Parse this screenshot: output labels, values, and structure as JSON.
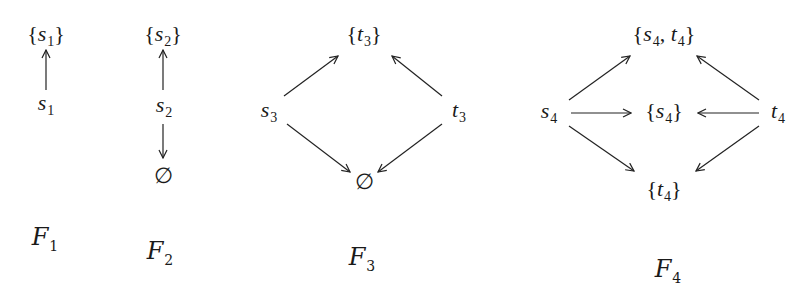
{
  "figure": {
    "diagrams": [
      {
        "label": "F",
        "label_sub": "1",
        "nodes": {
          "top": {
            "pre": "{",
            "var": "s",
            "sub": "1",
            "post": "}"
          },
          "source": {
            "var": "s",
            "sub": "1"
          }
        },
        "edges": [
          [
            "source",
            "top"
          ]
        ]
      },
      {
        "label": "F",
        "label_sub": "2",
        "nodes": {
          "top": {
            "pre": "{",
            "var": "s",
            "sub": "2",
            "post": "}"
          },
          "source": {
            "var": "s",
            "sub": "2"
          },
          "bottom": {
            "symbol": "∅"
          }
        },
        "edges": [
          [
            "source",
            "top"
          ],
          [
            "source",
            "bottom"
          ]
        ]
      },
      {
        "label": "F",
        "label_sub": "3",
        "nodes": {
          "top": {
            "pre": "{",
            "var": "t",
            "sub": "3",
            "post": "}"
          },
          "left": {
            "var": "s",
            "sub": "3"
          },
          "right": {
            "var": "t",
            "sub": "3"
          },
          "bottom": {
            "symbol": "∅"
          }
        },
        "edges": [
          [
            "left",
            "top"
          ],
          [
            "right",
            "top"
          ],
          [
            "left",
            "bottom"
          ],
          [
            "right",
            "bottom"
          ]
        ]
      },
      {
        "label": "F",
        "label_sub": "4",
        "nodes": {
          "top": {
            "pre": "{",
            "var": "s",
            "sub": "4",
            "mid": ", ",
            "var2": "t",
            "sub2": "4",
            "post": "}"
          },
          "left": {
            "var": "s",
            "sub": "4"
          },
          "middle": {
            "pre": "{",
            "var": "s",
            "sub": "4",
            "post": "}"
          },
          "right": {
            "var": "t",
            "sub": "4"
          },
          "bottom": {
            "pre": "{",
            "var": "t",
            "sub": "4",
            "post": "}"
          }
        },
        "edges": [
          [
            "left",
            "top"
          ],
          [
            "right",
            "top"
          ],
          [
            "left",
            "middle"
          ],
          [
            "right",
            "middle"
          ],
          [
            "left",
            "bottom"
          ],
          [
            "right",
            "bottom"
          ]
        ]
      }
    ]
  }
}
